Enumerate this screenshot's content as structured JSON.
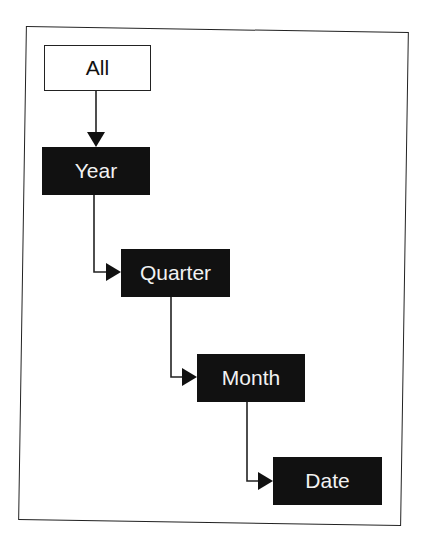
{
  "diagram": {
    "type": "hierarchy",
    "nodes": [
      {
        "id": "all",
        "label": "All",
        "style": "outlined"
      },
      {
        "id": "year",
        "label": "Year",
        "style": "filled"
      },
      {
        "id": "quarter",
        "label": "Quarter",
        "style": "filled"
      },
      {
        "id": "month",
        "label": "Month",
        "style": "filled"
      },
      {
        "id": "date",
        "label": "Date",
        "style": "filled"
      }
    ],
    "edges": [
      {
        "from": "all",
        "to": "year"
      },
      {
        "from": "year",
        "to": "quarter"
      },
      {
        "from": "quarter",
        "to": "month"
      },
      {
        "from": "month",
        "to": "date"
      }
    ],
    "colors": {
      "filled_bg": "#111111",
      "filled_text": "#f2f2f2",
      "line": "#222222"
    }
  }
}
